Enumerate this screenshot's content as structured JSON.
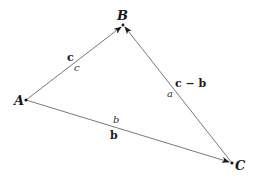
{
  "diagram": {
    "type": "vector-triangle",
    "colors": {
      "edge": "#6a6a6a",
      "text": "#1a1a1a",
      "background": "#ffffff"
    },
    "vertices": [
      {
        "id": "A",
        "label": "A",
        "x": 26,
        "y": 100
      },
      {
        "id": "B",
        "label": "B",
        "x": 123,
        "y": 25
      },
      {
        "id": "C",
        "label": "C",
        "x": 232,
        "y": 163
      }
    ],
    "edges": [
      {
        "from": "A",
        "to": "B",
        "vector_label": "c",
        "length_label": "c"
      },
      {
        "from": "A",
        "to": "C",
        "vector_label": "b",
        "length_label": "b"
      },
      {
        "from": "C",
        "to": "B",
        "vector_label": "c − b",
        "length_label": "a"
      }
    ]
  }
}
